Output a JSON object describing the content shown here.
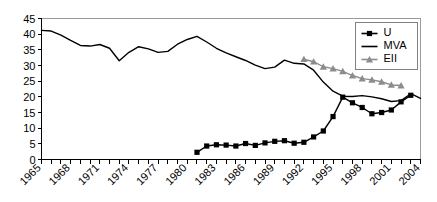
{
  "chart_data": {
    "type": "line",
    "title": "",
    "subtitle": "",
    "xlabel": "",
    "ylabel": "",
    "xlim": [
      1965,
      2004
    ],
    "ylim": [
      0,
      45
    ],
    "grid": false,
    "legend_position": "top-right",
    "y_ticks": [
      0,
      5,
      10,
      15,
      20,
      25,
      30,
      35,
      40,
      45
    ],
    "y_tick_labels": [
      "0",
      "5",
      "10",
      "15",
      "20",
      "25",
      "30",
      "35",
      "40",
      "45"
    ],
    "x_ticks": [
      1965,
      1966,
      1967,
      1968,
      1969,
      1970,
      1971,
      1972,
      1973,
      1974,
      1975,
      1976,
      1977,
      1978,
      1979,
      1980,
      1981,
      1982,
      1983,
      1984,
      1985,
      1986,
      1987,
      1988,
      1989,
      1990,
      1991,
      1992,
      1993,
      1994,
      1995,
      1996,
      1997,
      1998,
      1999,
      2000,
      2001,
      2002,
      2003,
      2004
    ],
    "x_tick_labels": [
      "1965",
      "1968",
      "1971",
      "1974",
      "1977",
      "1980",
      "1983",
      "1986",
      "1989",
      "1992",
      "1995",
      "1998",
      "2001",
      "2004"
    ],
    "x_tick_label_years": [
      1965,
      1968,
      1971,
      1974,
      1977,
      1980,
      1983,
      1986,
      1989,
      1992,
      1995,
      1998,
      2001,
      2004
    ],
    "series": [
      {
        "name": "U",
        "marker": "square",
        "color": "#000000",
        "x": [
          1981,
          1982,
          1983,
          1984,
          1985,
          1986,
          1987,
          1988,
          1989,
          1990,
          1991,
          1992,
          1993,
          1994,
          1995,
          1996,
          1997,
          1998,
          1999,
          2000,
          2001,
          2002,
          2003
        ],
        "values": [
          2.3,
          4.3,
          4.7,
          4.6,
          4.3,
          5.1,
          4.5,
          5.3,
          5.8,
          6.0,
          5.2,
          5.5,
          7.2,
          9.1,
          13.7,
          19.9,
          18.1,
          16.6,
          14.6,
          15.0,
          15.8,
          18.4,
          20.5
        ]
      },
      {
        "name": "MVA",
        "marker": "none",
        "color": "#000000",
        "x": [
          1965,
          1966,
          1967,
          1968,
          1969,
          1970,
          1971,
          1972,
          1973,
          1974,
          1975,
          1976,
          1977,
          1978,
          1979,
          1980,
          1981,
          1982,
          1983,
          1984,
          1985,
          1986,
          1987,
          1988,
          1989,
          1990,
          1991,
          1992,
          1993,
          1994,
          1995,
          1996,
          1997,
          1998,
          1999,
          2000,
          2001,
          2002,
          2003,
          2004
        ],
        "values": [
          41.2,
          41.0,
          39.7,
          38.0,
          36.4,
          36.2,
          36.7,
          35.5,
          31.5,
          34.2,
          36.0,
          35.3,
          34.2,
          34.5,
          36.8,
          38.3,
          39.3,
          37.5,
          35.5,
          34.0,
          32.8,
          31.6,
          30.1,
          29.0,
          29.5,
          31.7,
          30.7,
          30.5,
          28.5,
          24.7,
          21.8,
          20.2,
          20.1,
          20.4,
          20.0,
          19.4,
          18.5,
          18.8,
          21.0,
          19.5
        ]
      },
      {
        "name": "EII",
        "marker": "triangle",
        "color": "#8c8c8c",
        "x": [
          1992,
          1993,
          1994,
          1995,
          1996,
          1997,
          1998,
          1999,
          2000,
          2001,
          2002
        ],
        "values": [
          32.0,
          31.2,
          29.6,
          29.0,
          28.1,
          26.8,
          25.8,
          25.4,
          24.8,
          23.8,
          23.6
        ]
      }
    ]
  },
  "legend": {
    "items": [
      {
        "label": "U",
        "marker": "square",
        "color": "#000000"
      },
      {
        "label": "MVA",
        "marker": "none",
        "color": "#000000"
      },
      {
        "label": "EII",
        "marker": "triangle",
        "color": "#8c8c8c"
      }
    ]
  },
  "colors": {
    "u": "#000000",
    "mva": "#000000",
    "eii": "#8c8c8c",
    "axis": "#000000",
    "plot_border": "#9a9a9a",
    "background": "#ffffff"
  }
}
